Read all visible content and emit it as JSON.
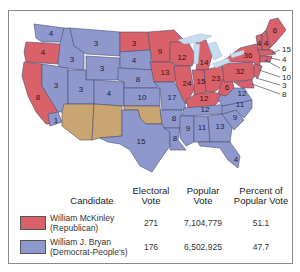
{
  "map": {
    "title": "Election of 1896",
    "colors": {
      "republican": "#d9616a",
      "democrat": "#8e98cc",
      "territory": "#c9a572",
      "water": "#c8dcef",
      "border": "#4a4f6e"
    },
    "states": [
      {
        "abbr": "WA",
        "votes": "4",
        "party": "democrat"
      },
      {
        "abbr": "OR",
        "votes": "4",
        "party": "republican"
      },
      {
        "abbr": "CA",
        "votes": "8",
        "party": "republican",
        "note": "1 split to Bryan"
      },
      {
        "abbr": "ID",
        "votes": "3",
        "party": "democrat"
      },
      {
        "abbr": "NV",
        "votes": "3",
        "party": "democrat"
      },
      {
        "abbr": "MT",
        "votes": "3",
        "party": "democrat"
      },
      {
        "abbr": "WY",
        "votes": "3",
        "party": "democrat"
      },
      {
        "abbr": "UT",
        "votes": "3",
        "party": "democrat"
      },
      {
        "abbr": "CO",
        "votes": "4",
        "party": "democrat"
      },
      {
        "abbr": "ND",
        "votes": "3",
        "party": "republican"
      },
      {
        "abbr": "SD",
        "votes": "4",
        "party": "democrat"
      },
      {
        "abbr": "NE",
        "votes": "8",
        "party": "democrat"
      },
      {
        "abbr": "KS",
        "votes": "10",
        "party": "democrat"
      },
      {
        "abbr": "TX",
        "votes": "15",
        "party": "democrat"
      },
      {
        "abbr": "MN",
        "votes": "9",
        "party": "republican"
      },
      {
        "abbr": "IA",
        "votes": "13",
        "party": "republican"
      },
      {
        "abbr": "MO",
        "votes": "17",
        "party": "democrat"
      },
      {
        "abbr": "AR",
        "votes": "8",
        "party": "democrat"
      },
      {
        "abbr": "LA",
        "votes": "8",
        "party": "democrat"
      },
      {
        "abbr": "WI",
        "votes": "12",
        "party": "republican"
      },
      {
        "abbr": "IL",
        "votes": "24",
        "party": "republican"
      },
      {
        "abbr": "MI",
        "votes": "14",
        "party": "republican"
      },
      {
        "abbr": "IN",
        "votes": "15",
        "party": "republican"
      },
      {
        "abbr": "OH",
        "votes": "23",
        "party": "republican"
      },
      {
        "abbr": "KY",
        "votes": "12",
        "party": "republican"
      },
      {
        "abbr": "TN",
        "votes": "12",
        "party": "democrat"
      },
      {
        "abbr": "MS",
        "votes": "9",
        "party": "democrat"
      },
      {
        "abbr": "AL",
        "votes": "11",
        "party": "democrat"
      },
      {
        "abbr": "GA",
        "votes": "13",
        "party": "democrat"
      },
      {
        "abbr": "FL",
        "votes": "4",
        "party": "democrat"
      },
      {
        "abbr": "SC",
        "votes": "9",
        "party": "democrat"
      },
      {
        "abbr": "NC",
        "votes": "11",
        "party": "democrat"
      },
      {
        "abbr": "VA",
        "votes": "12",
        "party": "democrat"
      },
      {
        "abbr": "WV",
        "votes": "6",
        "party": "republican"
      },
      {
        "abbr": "PA",
        "votes": "32",
        "party": "republican"
      },
      {
        "abbr": "NY",
        "votes": "36",
        "party": "republican"
      },
      {
        "abbr": "VT",
        "votes": "4",
        "party": "republican"
      },
      {
        "abbr": "NH",
        "votes": "4",
        "party": "republican"
      },
      {
        "abbr": "ME",
        "votes": "6",
        "party": "republican"
      },
      {
        "abbr": "MA",
        "votes": "15",
        "party": "republican"
      },
      {
        "abbr": "RI",
        "votes": "4",
        "party": "republican"
      },
      {
        "abbr": "CT",
        "votes": "6",
        "party": "republican"
      },
      {
        "abbr": "NJ",
        "votes": "10",
        "party": "republican"
      },
      {
        "abbr": "DE",
        "votes": "3",
        "party": "republican"
      },
      {
        "abbr": "MD",
        "votes": "8",
        "party": "republican"
      }
    ],
    "labels": {
      "wa": "4",
      "or": "4",
      "ca": "8",
      "ca_split": "1",
      "id": "3",
      "nv": "3",
      "mt": "3",
      "wy": "3",
      "ut": "3",
      "co": "4",
      "nd": "3",
      "sd": "4",
      "ne": "8",
      "ks": "10",
      "tx": "15",
      "mn": "9",
      "ia": "13",
      "mo": "17",
      "ar": "8",
      "la": "8",
      "wi": "12",
      "il": "24",
      "mi": "14",
      "in": "15",
      "oh": "23",
      "ky": "12",
      "tn": "12",
      "ms": "9",
      "al": "11",
      "ga": "13",
      "fl": "4",
      "sc": "9",
      "nc": "11",
      "va": "12",
      "wv": "6",
      "pa": "32",
      "ny": "36",
      "vt": "4",
      "nh": "4",
      "me": "6",
      "ma": "15",
      "ri": "4",
      "ct": "6",
      "nj": "10",
      "de": "3",
      "md": "8"
    }
  },
  "legend": {
    "headers": {
      "candidate": "Candidate",
      "electoral_1": "Electoral",
      "electoral_2": "Vote",
      "popular_1": "Popular",
      "popular_2": "Vote",
      "percent_1": "Percent of",
      "percent_2": "Popular Vote"
    },
    "rows": [
      {
        "name": "William McKinley",
        "party": "(Republican)",
        "electoral": "271",
        "popular": "7,104,779",
        "percent": "51.1",
        "color": "#d9616a"
      },
      {
        "name": "William J. Bryan",
        "party": "(Democrat-People's)",
        "electoral": "176",
        "popular": "6,502,925",
        "percent": "47.7",
        "color": "#8e98cc"
      }
    ]
  }
}
